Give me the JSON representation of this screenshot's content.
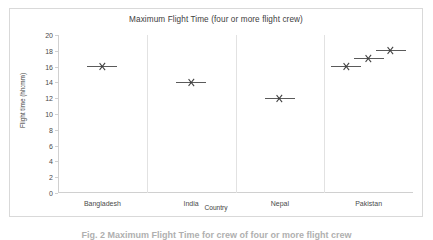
{
  "figure": {
    "caption": "Fig. 2  Maximum Flight Time for crew of four or more flight crew"
  },
  "chart_data": {
    "type": "scatter",
    "title": "Maximum Flight Time (four or more flight crew)",
    "xlabel": "Country",
    "ylabel": "Flight time (hh:mm)",
    "categories": [
      "Bangladesh",
      "India",
      "Nepal",
      "Pakistan"
    ],
    "ylim": [
      0,
      20
    ],
    "ytick_labels": [
      "0",
      "2",
      "4",
      "6",
      "8",
      "10",
      "12",
      "14",
      "16",
      "18",
      "20"
    ],
    "ytick_values": [
      0,
      2,
      4,
      6,
      8,
      10,
      12,
      14,
      16,
      18,
      20
    ],
    "grid": "vertical-category-separators",
    "legend": "none",
    "marker": "x-with-horizontal-line",
    "marker_color": "#3f3f3f",
    "points": [
      {
        "category": "Bangladesh",
        "offset": 0.5,
        "value": 16
      },
      {
        "category": "India",
        "offset": 0.5,
        "value": 14
      },
      {
        "category": "Nepal",
        "offset": 0.5,
        "value": 12
      },
      {
        "category": "Pakistan",
        "offset": 0.25,
        "value": 16
      },
      {
        "category": "Pakistan",
        "offset": 0.5,
        "value": 17
      },
      {
        "category": "Pakistan",
        "offset": 0.75,
        "value": 18
      }
    ]
  },
  "colors": {
    "frame": "#d9d9d9",
    "axis": "#d0d0d0",
    "gridline": "#e2e2e2",
    "text": "#404040",
    "background": "#ffffff"
  }
}
